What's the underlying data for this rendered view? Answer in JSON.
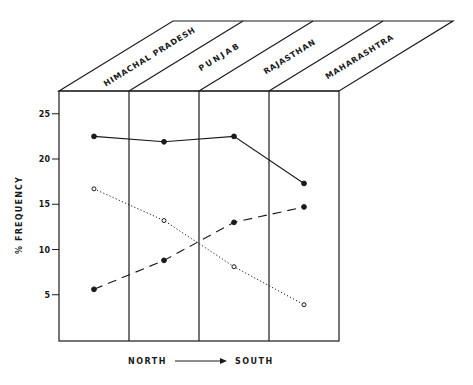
{
  "chart_data": {
    "type": "line",
    "title": "",
    "style": "3D box diagram with state panels",
    "categories": [
      "HIMACHAL PRADESH",
      "PUNJAB",
      "RAJASTHAN",
      "MAHARASHTRA"
    ],
    "xlabel": "NORTH → SOUTH",
    "xlabel_left": "NORTH",
    "xlabel_right": "SOUTH",
    "ylabel": "% FREQUENCY",
    "ylim": [
      0,
      27
    ],
    "yticks": [
      5,
      10,
      15,
      20,
      25
    ],
    "grid": false,
    "legend": "none",
    "series": [
      {
        "name": "series-1 (solid, filled dots)",
        "line": "solid",
        "marker": "filled",
        "values": [
          22.5,
          21.9,
          22.5,
          17.3
        ]
      },
      {
        "name": "series-2 (dotted, open dots)",
        "line": "dotted",
        "marker": "open",
        "values": [
          16.7,
          13.2,
          8.1,
          3.9
        ]
      },
      {
        "name": "series-3 (dashed, filled dots)",
        "line": "dashed",
        "marker": "filled",
        "values": [
          5.6,
          8.8,
          13.0,
          14.7
        ]
      }
    ]
  },
  "axis": {
    "y_label": "% FREQUENCY",
    "y_ticks": [
      "5",
      "10",
      "15",
      "20",
      "25"
    ]
  },
  "footer": {
    "north": "NORTH",
    "south": "SOUTH"
  }
}
